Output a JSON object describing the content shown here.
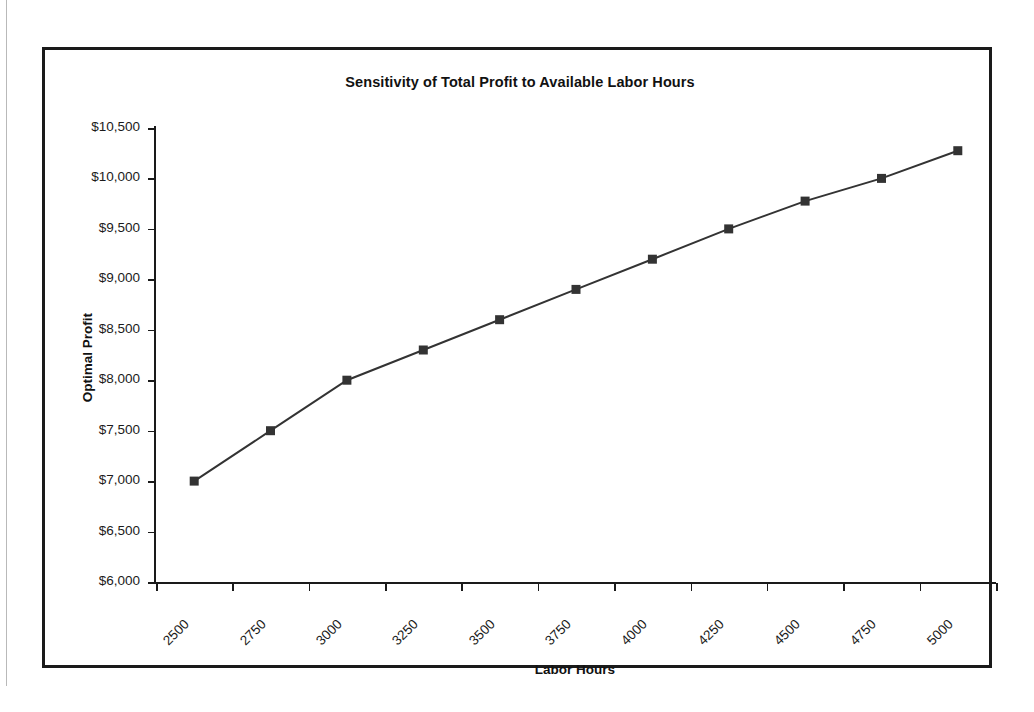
{
  "page": {
    "clipped_text_above": "",
    "margin_rule": true
  },
  "chart_data": {
    "type": "line",
    "title": "Sensitivity of Total Profit to Available Labor Hours",
    "xlabel": "Labor Hours",
    "ylabel": "Optimal Profit",
    "categories": [
      "2500",
      "2750",
      "3000",
      "3250",
      "3500",
      "3750",
      "4000",
      "4250",
      "4500",
      "4750",
      "5000"
    ],
    "values": [
      7000,
      7500,
      8000,
      8300,
      8600,
      8900,
      9200,
      9500,
      9775,
      10000,
      10275
    ],
    "ylim": [
      6000,
      10500
    ],
    "ytick_step": 500,
    "ytick_labels": [
      "$10,500",
      "$10,000",
      "$9,500",
      "$9,000",
      "$8,500",
      "$8,000",
      "$7,500",
      "$7,000",
      "$6,500",
      "$6,000"
    ],
    "ytick_values": [
      10500,
      10000,
      9500,
      9000,
      8500,
      8000,
      7500,
      7000,
      6500,
      6000
    ],
    "grid": false,
    "legend": "none",
    "marker": "square",
    "series_color": "#333333",
    "line_width": 2,
    "marker_size": 9,
    "x_label_rotation": -45
  }
}
